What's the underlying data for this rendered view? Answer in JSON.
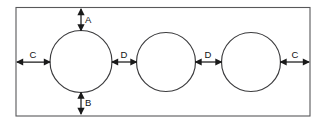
{
  "diagram": {
    "canvas": {
      "width": 322,
      "height": 126
    },
    "colors": {
      "background": "#ffffff",
      "plate_stroke": "#58585a",
      "circle_stroke": "#3b3b3d",
      "dimension_stroke": "#1a1a1a",
      "label_text": "#111111"
    },
    "plate": {
      "name": "rectangular-plate",
      "x": 16,
      "y": 7.5,
      "width": 294,
      "height": 108.5
    },
    "holes": [
      {
        "name": "hole-left",
        "cx": 81,
        "cy": 61.5,
        "r": 31
      },
      {
        "name": "hole-middle",
        "cx": 166,
        "cy": 62,
        "r": 29.5
      },
      {
        "name": "hole-right",
        "cx": 251,
        "cy": 62,
        "r": 29.5
      }
    ],
    "dimensions": [
      {
        "id": "A",
        "label": "A",
        "orientation": "vertical",
        "description": "top edge of plate to top of left hole",
        "x": 81,
        "y1": 9,
        "y2": 30.5,
        "label_x": 85,
        "label_y": 20
      },
      {
        "id": "B",
        "label": "B",
        "orientation": "vertical",
        "description": "bottom of left hole to bottom edge of plate",
        "x": 81,
        "y1": 92.5,
        "y2": 114,
        "label_x": 85,
        "label_y": 103
      },
      {
        "id": "C-left",
        "label": "C",
        "orientation": "horizontal",
        "description": "left edge of plate to left of first hole",
        "y": 62,
        "x1": 17,
        "x2": 50,
        "label_x": 33,
        "label_y": 55
      },
      {
        "id": "D-left",
        "label": "D",
        "orientation": "horizontal",
        "description": "gap between first and second holes",
        "y": 62,
        "x1": 112,
        "x2": 136.5,
        "label_x": 124,
        "label_y": 55
      },
      {
        "id": "D-right",
        "label": "D",
        "orientation": "horizontal",
        "description": "gap between second and third holes",
        "y": 62,
        "x1": 195.5,
        "x2": 221.5,
        "label_x": 208,
        "label_y": 55
      },
      {
        "id": "C-right",
        "label": "C",
        "orientation": "horizontal",
        "description": "right of third hole to right edge of plate",
        "y": 62,
        "x1": 280.5,
        "x2": 309,
        "label_x": 295,
        "label_y": 55
      }
    ]
  }
}
